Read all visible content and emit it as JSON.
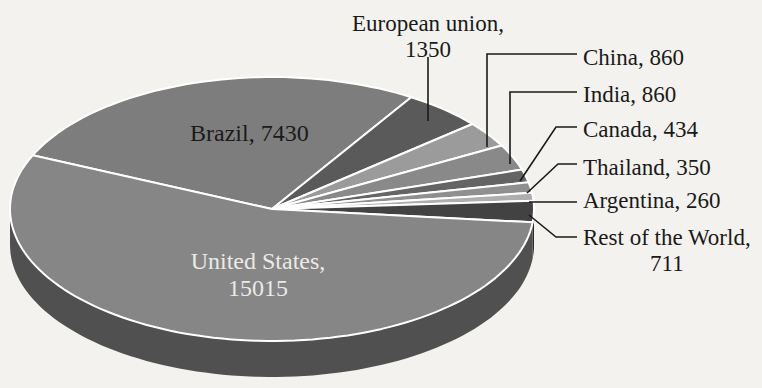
{
  "figure": {
    "background": "#f3f2ee",
    "separator_color": "#ffffff",
    "leader_line_color": "#1a1a1a",
    "inside_label_light_color": "#eceae6",
    "label_color": "#1a1a1a"
  },
  "chart_data": {
    "type": "pie",
    "style": "3d-exploded-none",
    "title": "",
    "legend": "none",
    "direction": "clockwise",
    "start_angle_deg": 156,
    "categories": [
      "Brazil",
      "European union",
      "China",
      "India",
      "Canada",
      "Thailand",
      "Argentina",
      "Rest of the World",
      "United States"
    ],
    "values": [
      7430,
      1350,
      860,
      860,
      434,
      350,
      260,
      711,
      15015
    ],
    "slices": [
      {
        "label": "Brazil",
        "value": 7430,
        "color": "#7d7d7d"
      },
      {
        "label": "European union",
        "value": 1350,
        "color": "#5a5a5a"
      },
      {
        "label": "China",
        "value": 860,
        "color": "#9b9b9b"
      },
      {
        "label": "India",
        "value": 860,
        "color": "#898989"
      },
      {
        "label": "Canada",
        "value": 434,
        "color": "#646464"
      },
      {
        "label": "Thailand",
        "value": 350,
        "color": "#8f8f8f"
      },
      {
        "label": "Argentina",
        "value": 260,
        "color": "#aeaeae"
      },
      {
        "label": "Rest of the World",
        "value": 711,
        "color": "#424242"
      },
      {
        "label": "United States",
        "value": 15015,
        "color": "#868686"
      }
    ],
    "callouts": [
      {
        "id": "european-union",
        "text": "European union,\n1350"
      },
      {
        "id": "china",
        "text": "China, 860"
      },
      {
        "id": "india",
        "text": "India, 860"
      },
      {
        "id": "canada",
        "text": "Canada, 434"
      },
      {
        "id": "thailand",
        "text": "Thailand, 350"
      },
      {
        "id": "argentina",
        "text": "Argentina, 260"
      },
      {
        "id": "rest-of-world",
        "text": "Rest of the World,\n711"
      },
      {
        "id": "brazil",
        "text": "Brazil, 7430"
      },
      {
        "id": "united-states",
        "text": "United States,\n15015"
      }
    ]
  }
}
